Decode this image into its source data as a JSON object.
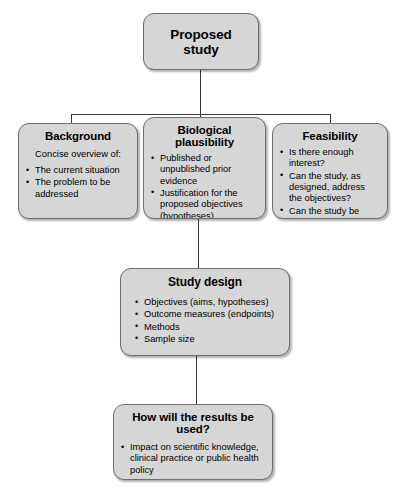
{
  "diagram": {
    "colors": {
      "node_fill": "#d6d6d6",
      "node_border": "#6e6e6e",
      "connector": "#3a3a3a",
      "background": "#ffffff",
      "text": "#000000"
    },
    "nodes": {
      "proposed_study": {
        "title": "Proposed study",
        "lead": "",
        "items": []
      },
      "background": {
        "title": "Background",
        "lead": "Concise overview of:",
        "items": [
          "The current situation",
          "The problem to be addressed"
        ]
      },
      "biological_plausibility": {
        "title": "Biological plausibility",
        "lead": "",
        "items": [
          "Published or unpublished prior evidence",
          "Justification for the proposed objectives (hypotheses)"
        ]
      },
      "feasibility": {
        "title": "Feasibility",
        "lead": "",
        "items": [
          "Is there enough interest?",
          "Can the study, as designed, address the objectives?",
          "Can the study be completed on time?"
        ]
      },
      "study_design": {
        "title": "Study design",
        "lead": "",
        "items": [
          "Objectives (aims, hypotheses)",
          "Outcome measures (endpoints)",
          "Methods",
          "Sample size"
        ]
      },
      "results_used": {
        "title": "How will the results be used?",
        "lead": "",
        "items": [
          "Impact on scientific knowledge, clinical practice or public health policy",
          "What is expected to happen next?"
        ]
      }
    }
  }
}
